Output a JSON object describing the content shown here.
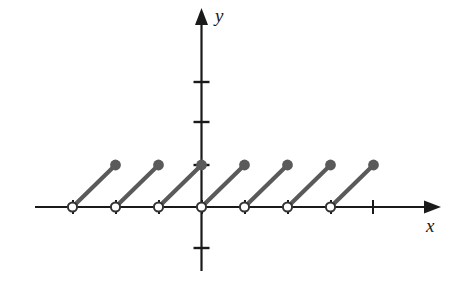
{
  "figure": {
    "background_color": "#ffffff",
    "axis_color": "#1a1a1a",
    "segment_color": "#5a5a5a",
    "open_circle_fill": "#ffffff",
    "open_circle_stroke": "#333333",
    "x_axis_label": "x",
    "y_axis_label": "y"
  },
  "chart_data": {
    "type": "line",
    "title": "",
    "xlabel": "x",
    "ylabel": "y",
    "xlim": [
      -3.9,
      5.6
    ],
    "ylim": [
      -1.5,
      3.9
    ],
    "grid": false,
    "legend": null,
    "x_ticks": [
      -3,
      -2,
      -1,
      0,
      1,
      2,
      3,
      4
    ],
    "y_ticks": [
      -1,
      1,
      2,
      3
    ],
    "series": [
      {
        "name": "sawtooth",
        "segments": [
          {
            "from": [
              -3,
              0
            ],
            "to": [
              -2,
              1
            ],
            "start_point": "open",
            "end_point": "closed"
          },
          {
            "from": [
              -2,
              0
            ],
            "to": [
              -1,
              1
            ],
            "start_point": "open",
            "end_point": "closed"
          },
          {
            "from": [
              -1,
              0
            ],
            "to": [
              0,
              1
            ],
            "start_point": "open",
            "end_point": "closed"
          },
          {
            "from": [
              0,
              0
            ],
            "to": [
              1,
              1
            ],
            "start_point": "open",
            "end_point": "closed"
          },
          {
            "from": [
              1,
              0
            ],
            "to": [
              2,
              1
            ],
            "start_point": "open",
            "end_point": "closed"
          },
          {
            "from": [
              2,
              0
            ],
            "to": [
              3,
              1
            ],
            "start_point": "open",
            "end_point": "closed"
          },
          {
            "from": [
              3,
              0
            ],
            "to": [
              4,
              1
            ],
            "start_point": "open",
            "end_point": "closed"
          }
        ]
      }
    ],
    "open_points": [
      [
        -3,
        0
      ],
      [
        -2,
        0
      ],
      [
        -1,
        0
      ],
      [
        0,
        0
      ],
      [
        1,
        0
      ],
      [
        2,
        0
      ],
      [
        3,
        0
      ]
    ],
    "closed_points": [
      [
        -2,
        1
      ],
      [
        -1,
        1
      ],
      [
        0,
        1
      ],
      [
        1,
        1
      ],
      [
        2,
        1
      ],
      [
        3,
        1
      ],
      [
        4,
        1
      ]
    ]
  },
  "geometry": {
    "origin": {
      "x": 201.5,
      "y": 207
    },
    "unit_x": 43,
    "unit_y": 42,
    "x_axis_start": 35,
    "x_axis_end": 441,
    "y_axis_top": 8,
    "y_axis_bottom": 271,
    "tick_half_len_x": 7,
    "tick_half_len_y": 8,
    "x_tick_positions": [
      73,
      116,
      159,
      202,
      245,
      288,
      331,
      373
    ],
    "y_tick_positions": [
      82,
      122,
      165,
      248
    ],
    "open_circle_x": [
      73,
      116,
      159,
      202,
      245,
      288,
      331
    ],
    "closed_dot_x": [
      116,
      159,
      202,
      245,
      288,
      331,
      374
    ],
    "closed_dot_y": 165,
    "open_circle_y": 207,
    "x_label_pos": {
      "x": 426,
      "y": 232
    },
    "y_label_pos": {
      "x": 215,
      "y": 22
    }
  }
}
